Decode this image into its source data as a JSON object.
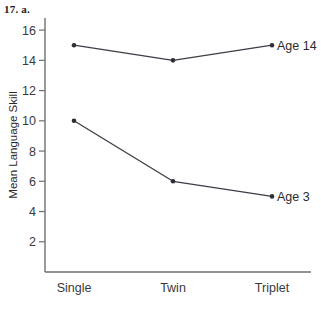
{
  "header": {
    "problem_label": "17. a."
  },
  "chart_data": {
    "type": "line",
    "title": "",
    "xlabel": "",
    "ylabel": "Mean Language Skill",
    "categories": [
      "Single",
      "Twin",
      "Triplet"
    ],
    "series": [
      {
        "name": "Age 14",
        "values": [
          15,
          14,
          15
        ]
      },
      {
        "name": "Age 3",
        "values": [
          10,
          6,
          5
        ]
      }
    ],
    "yticks": [
      2,
      4,
      6,
      8,
      10,
      12,
      14,
      16
    ],
    "ylim": [
      0,
      16.8
    ],
    "grid": false,
    "legend_position": "inline-right",
    "line_color": "#3d3d46",
    "marker_color": "#2e2e36",
    "axis_color": "#6f6f6f"
  }
}
